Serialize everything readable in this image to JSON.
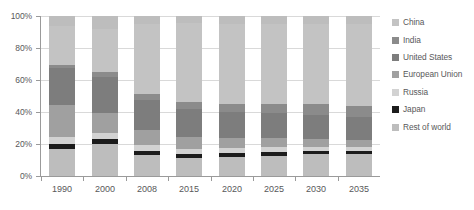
{
  "chart_data": {
    "type": "bar",
    "subtype": "stacked-100-percent",
    "title": "",
    "xlabel": "",
    "ylabel": "",
    "ylim": [
      0,
      100
    ],
    "ytick_labels": [
      "0%",
      "20%",
      "40%",
      "60%",
      "80%",
      "100%"
    ],
    "ytick_values": [
      0,
      20,
      40,
      60,
      80,
      100
    ],
    "grid": true,
    "legend_position": "right",
    "categories": [
      "1990",
      "2000",
      "2008",
      "2015",
      "2020",
      "2025",
      "2030",
      "2035"
    ],
    "series": [
      {
        "name": "China",
        "color": "#c3c3c3",
        "values": [
          23.8,
          27.4,
          43.4,
          49.0,
          50.0,
          50.0,
          50.0,
          51.0
        ]
      },
      {
        "name": "India",
        "color": "#8b8b8b",
        "values": [
          1.9,
          3.1,
          3.8,
          4.4,
          5.0,
          5.6,
          6.3,
          6.9
        ]
      },
      {
        "name": "United States",
        "color": "#7d7d7d",
        "values": [
          23.3,
          22.0,
          18.9,
          17.6,
          16.3,
          15.7,
          15.1,
          14.5
        ]
      },
      {
        "name": "European Union",
        "color": "#a0a0a0",
        "values": [
          20.1,
          12.6,
          9.4,
          7.5,
          6.3,
          5.7,
          5.0,
          4.4
        ]
      },
      {
        "name": "Russia",
        "color": "#d2d2d2",
        "values": [
          4.4,
          3.8,
          3.8,
          3.1,
          3.1,
          3.1,
          2.5,
          2.5
        ]
      },
      {
        "name": "Japan",
        "color": "#1c1c1c",
        "values": [
          3.1,
          3.1,
          2.5,
          2.5,
          2.5,
          2.2,
          2.2,
          1.9
        ]
      },
      {
        "name": "Rest of world",
        "color": "#bdbdbd",
        "values": [
          23.4,
          28.0,
          18.2,
          15.9,
          16.8,
          17.7,
          18.9,
          18.8
        ]
      }
    ],
    "stack_order_top_to_bottom": [
      "Rest of world",
      "China",
      "India",
      "United States",
      "European Union",
      "Russia",
      "Japan",
      "Rest of world"
    ]
  },
  "legend": {
    "items": [
      {
        "label": "China",
        "color": "#c3c3c3"
      },
      {
        "label": "India",
        "color": "#8b8b8b"
      },
      {
        "label": "United States",
        "color": "#7d7d7d"
      },
      {
        "label": "European Union",
        "color": "#a0a0a0"
      },
      {
        "label": "Russia",
        "color": "#d2d2d2"
      },
      {
        "label": "Japan",
        "color": "#1c1c1c"
      },
      {
        "label": "Rest of world",
        "color": "#bdbdbd"
      }
    ]
  },
  "colors": {
    "axis": "#9a9a9a",
    "grid": "#d9d9d9",
    "text": "#58585a",
    "background": "#ffffff"
  }
}
